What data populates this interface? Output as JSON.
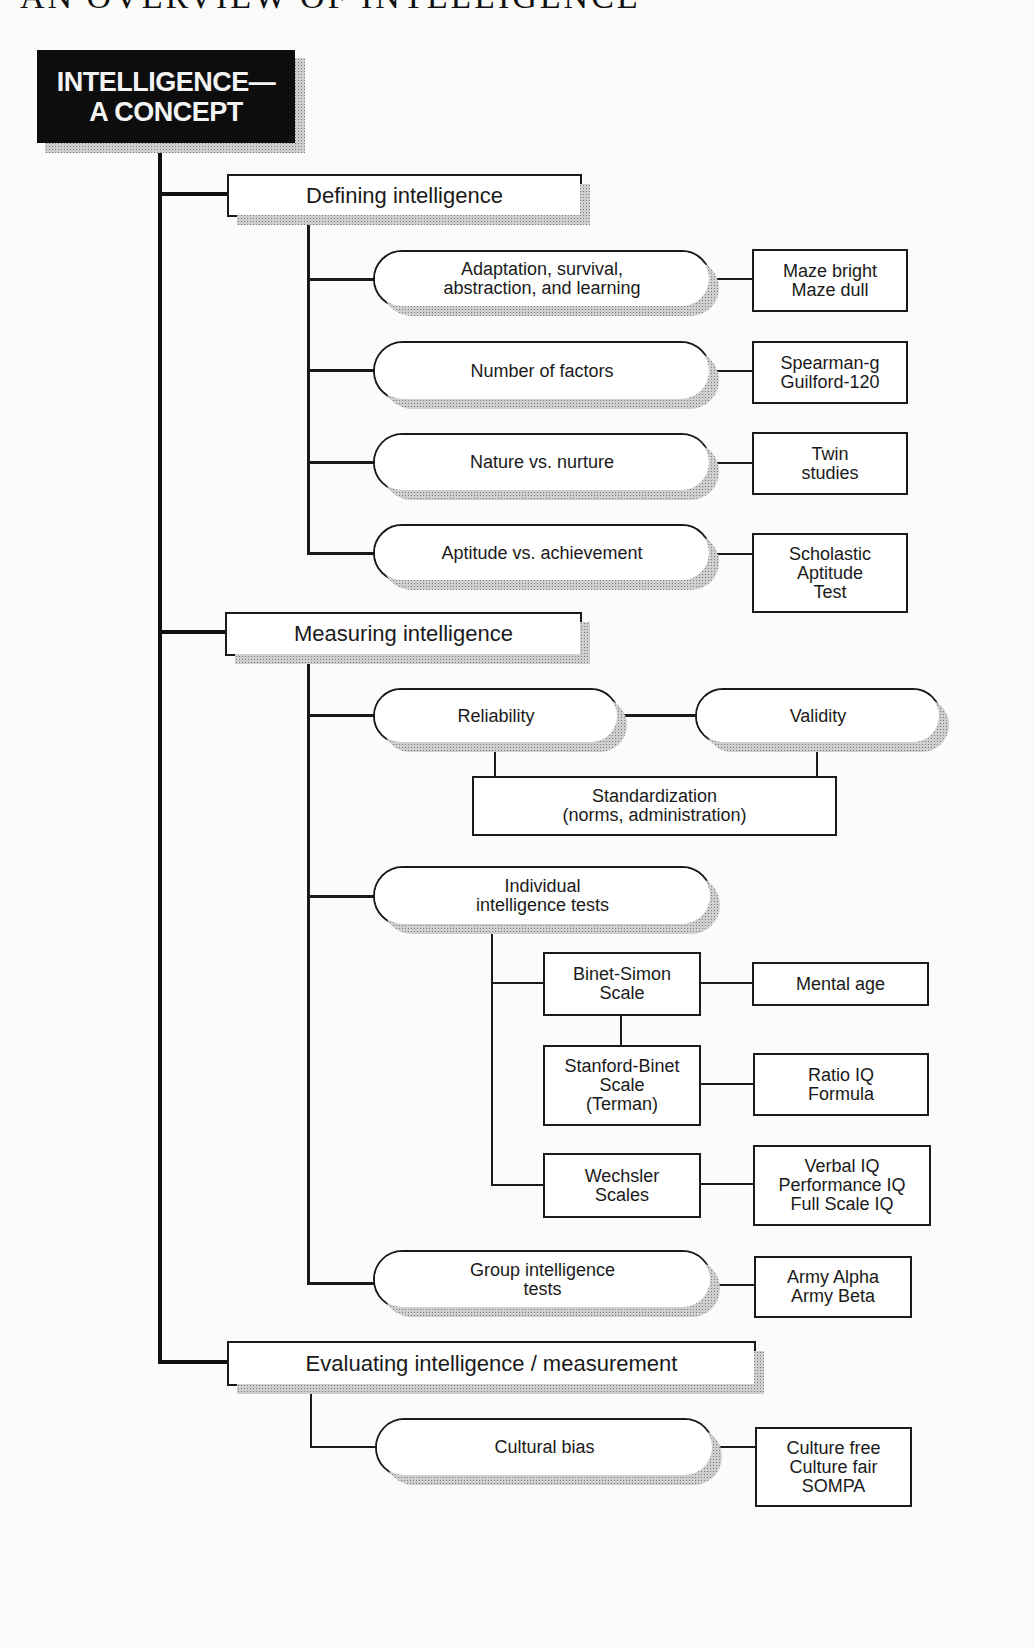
{
  "page": {
    "title": "AN OVERVIEW OF INTELLIGENCE"
  },
  "root": {
    "label": "INTELLIGENCE—\nA CONCEPT"
  },
  "sections": [
    {
      "label": "Defining intelligence",
      "children": [
        {
          "label": "Adaptation, survival,\nabstraction, and learning",
          "detail": "Maze bright\nMaze dull"
        },
        {
          "label": "Number of factors",
          "detail": "Spearman-g\nGuilford-120"
        },
        {
          "label": "Nature vs. nurture",
          "detail": "Twin\nstudies"
        },
        {
          "label": "Aptitude vs. achievement",
          "detail": "Scholastic\nAptitude\nTest"
        }
      ]
    },
    {
      "label": "Measuring intelligence",
      "reliability": "Reliability",
      "validity": "Validity",
      "standardization": "Standardization\n(norms, administration)",
      "individual_tests": {
        "label": "Individual\nintelligence tests",
        "scales": [
          {
            "label": "Binet-Simon\nScale",
            "detail": "Mental age"
          },
          {
            "label": "Stanford-Binet\nScale\n(Terman)",
            "detail": "Ratio IQ\nFormula"
          },
          {
            "label": "Wechsler\nScales",
            "detail": "Verbal IQ\nPerformance IQ\nFull Scale IQ"
          }
        ]
      },
      "group_tests": {
        "label": "Group intelligence\ntests",
        "detail": "Army Alpha\nArmy Beta"
      }
    },
    {
      "label": "Evaluating intelligence / measurement",
      "children": [
        {
          "label": "Cultural bias",
          "detail": "Culture free\nCulture fair\nSOMPA"
        }
      ]
    }
  ]
}
